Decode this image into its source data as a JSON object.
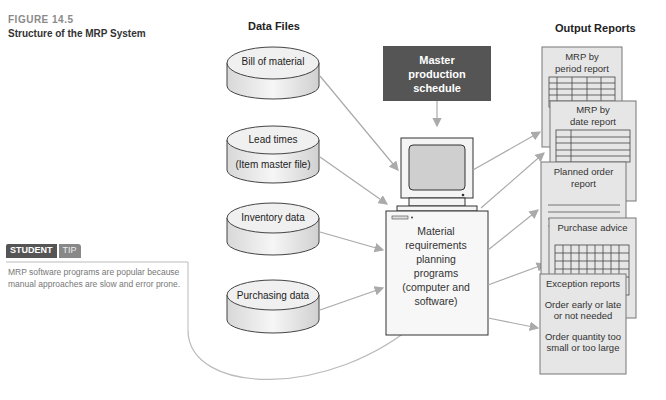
{
  "figure": {
    "number": "FIGURE 14.5",
    "title": "Structure of the MRP System"
  },
  "columns": {
    "data_files": "Data Files",
    "output_reports": "Output Reports"
  },
  "student_tip": {
    "tag_student": "STUDENT",
    "tag_tip": "TIP",
    "text": "MRP software programs are popular because manual approaches are slow and error prone."
  },
  "master_schedule": {
    "line1": "Master",
    "line2": "production schedule"
  },
  "data_files": [
    {
      "label": "Bill of material"
    },
    {
      "label": "Lead times",
      "sublabel": "(Item master file)"
    },
    {
      "label": "Inventory data"
    },
    {
      "label": "Purchasing data"
    }
  ],
  "computer": {
    "lines": [
      "Material",
      "requirements",
      "planning",
      "programs",
      "(computer and",
      "software)"
    ]
  },
  "reports": [
    {
      "lines": [
        "MRP by",
        "period report"
      ]
    },
    {
      "lines": [
        "MRP by",
        "date report"
      ]
    },
    {
      "lines": [
        "Planned order",
        "report"
      ]
    },
    {
      "lines": [
        "Purchase advice"
      ]
    },
    {
      "lines": [
        "Exception reports",
        "",
        "Order early or late",
        "or not needed",
        "",
        "Order quantity too",
        "small or too large"
      ]
    }
  ],
  "colors": {
    "mps_fill": "#555555",
    "arrow": "#aaaaaa",
    "report_fill": "#e8e8e8",
    "cylinder_fill": "#efefef"
  }
}
